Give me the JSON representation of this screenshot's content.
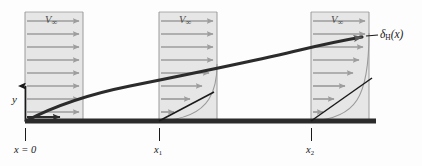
{
  "figure": {
    "type": "technical-diagram"
  },
  "labels": {
    "y_axis": "y",
    "x_origin": "x = 0",
    "x_one_base": "x",
    "x_one_sub": "1",
    "x_two_base": "x",
    "x_two_sub": "2",
    "delta_base": "δ",
    "delta_sub": "H",
    "delta_arg": "(x)",
    "freestream_base": "V",
    "freestream_sub": "∞"
  },
  "profiles": [
    {
      "name": "profile-x0",
      "label": "V∞",
      "arrow_count": 8,
      "x_station": "x = 0"
    },
    {
      "name": "profile-x1",
      "label": "V∞",
      "arrow_count": 8,
      "x_station": "x1"
    },
    {
      "name": "profile-x2",
      "label": "V∞",
      "arrow_count": 8,
      "x_station": "x2"
    }
  ],
  "colors": {
    "box_fill": "#e6e6e6",
    "box_stroke": "#9a9a9a",
    "arrow": "#9d9d9d",
    "plate": "#2b2b2b",
    "boundary_curve": "#2b2b2b",
    "tangent": "#1a1a1a",
    "text": "#1a1a1a",
    "background": "#fdfdfd"
  },
  "geometry": {
    "plate_y": 121,
    "plate_x_start": 25,
    "plate_x_end": 376,
    "stations_x": [
      25,
      159,
      311
    ],
    "box_width": 58,
    "box_top": 12,
    "delta_at_x1": 57,
    "delta_at_x2": 90
  }
}
